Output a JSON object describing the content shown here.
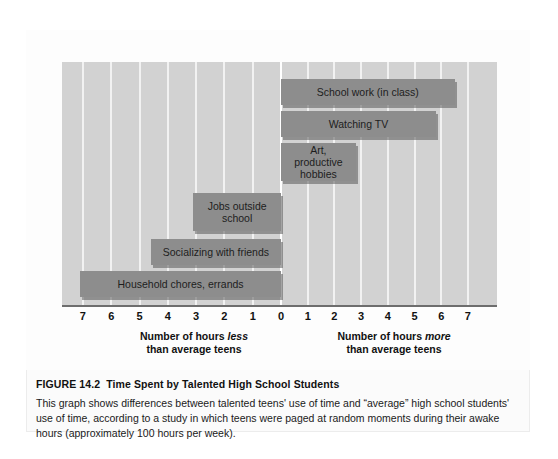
{
  "figure": {
    "number_label": "FIGURE 14.2",
    "title": "Time Spent by Talented High School Students",
    "body": "This graph shows differences between talented teens' use of time and “average” high school students' use of time, according to a study in which teens were paged at random moments during their awake hours (approximately 100 hours per week)."
  },
  "axis": {
    "left_caption_line1_pre": "Number of hours ",
    "left_caption_line1_em": "less",
    "left_caption_line2": "than average teens",
    "right_caption_line1_pre": "Number of hours ",
    "right_caption_line1_em": "more",
    "right_caption_line2": "than average teens",
    "ticks": [
      "7",
      "6",
      "5",
      "4",
      "3",
      "2",
      "1",
      "0",
      "1",
      "2",
      "3",
      "4",
      "5",
      "6",
      "7"
    ]
  },
  "colors": {
    "bar": "#8d8d8d",
    "bar_shadow": "#5a5a5a",
    "plot_background": "#d2d2d2",
    "gridline": "#f2f2f2",
    "axis_line": "#6d6d6d",
    "card_background": "#fbfbfb"
  },
  "chart_data": {
    "type": "bar",
    "orientation": "horizontal",
    "title": "Time Spent by Talented High School Students",
    "xlabel": "Number of hours less / more than average teens",
    "ylabel": "",
    "xlim": [
      -7.5,
      7.5
    ],
    "xticks": [
      -7,
      -6,
      -5,
      -4,
      -3,
      -2,
      -1,
      0,
      1,
      2,
      3,
      4,
      5,
      6,
      7
    ],
    "xticklabels": [
      "7",
      "6",
      "5",
      "4",
      "3",
      "2",
      "1",
      "0",
      "1",
      "2",
      "3",
      "4",
      "5",
      "6",
      "7"
    ],
    "grid": true,
    "legend": "none",
    "zero_reference": 0,
    "units": "hours per week relative to average teens",
    "categories": [
      "School work (in class)",
      "Watching TV",
      "Art, productive hobbies",
      "Jobs outside school",
      "Socializing with friends",
      "Household chores, errands"
    ],
    "values": [
      6.5,
      5.8,
      2.8,
      -3.1,
      -4.6,
      -7.1
    ],
    "bars": [
      {
        "label": "School work (in class)",
        "value": 6.5,
        "direction": "more",
        "label_multiline": "School work (in class)"
      },
      {
        "label": "Watching TV",
        "value": 5.8,
        "direction": "more",
        "label_multiline": "Watching TV"
      },
      {
        "label": "Art, productive hobbies",
        "value": 2.8,
        "direction": "more",
        "label_multiline": "Art, productive\nhobbies"
      },
      {
        "label": "Jobs outside school",
        "value": 3.1,
        "direction": "less",
        "label_multiline": "Jobs outside\nschool"
      },
      {
        "label": "Socializing with friends",
        "value": 4.6,
        "direction": "less",
        "label_multiline": "Socializing with friends"
      },
      {
        "label": "Household chores, errands",
        "value": 7.1,
        "direction": "less",
        "label_multiline": "Household chores, errands"
      }
    ]
  }
}
